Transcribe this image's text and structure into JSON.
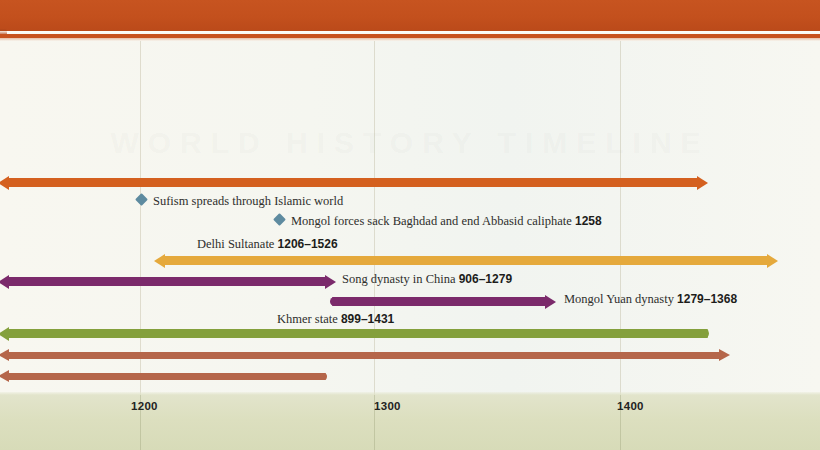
{
  "document": {
    "title": "World history timeline — 1100s to 1400s",
    "top_band_color": "#c8521f",
    "canvas_color": "#f8f7f0",
    "axis_band_color": "#dde0c2",
    "watermark_text": "WORLD HISTORY TIMELINE"
  },
  "axis": {
    "label": "",
    "ticks": [
      {
        "value": "1200",
        "x": 140
      },
      {
        "value": "1300",
        "x": 374
      },
      {
        "value": "1400",
        "x": 620
      }
    ],
    "gridlines": [
      140,
      374,
      620
    ]
  },
  "chart_data": {
    "type": "timeline",
    "title": "World history timeline",
    "xlabel": "",
    "ylabel": "",
    "xlim": [
      1150,
      1440
    ],
    "grid": true,
    "legend": "none",
    "tick_labels": [
      "1200",
      "1300",
      "1400"
    ],
    "bars": [
      {
        "id": "islamic-world-span",
        "label": "",
        "years": "",
        "color": "#d4601f",
        "start_px": 0,
        "end_px": 708,
        "row_y": 178,
        "start_cap": "arrow-left",
        "end_cap": "arrow-right",
        "thickness": "thick"
      },
      {
        "id": "delhi-sultanate",
        "label": "Delhi Sultanate",
        "years": "1206–1526",
        "color": "#e5a93c",
        "start_px": 156,
        "end_px": 778,
        "row_y": 256,
        "start_cap": "arrow-left",
        "end_cap": "arrow-right",
        "thickness": "thick"
      },
      {
        "id": "song-dynasty",
        "label": "Song dynasty in China",
        "years": "906–1279",
        "color": "#7b2a6b",
        "start_px": 0,
        "end_px": 336,
        "row_y": 277,
        "start_cap": "arrow-left",
        "end_cap": "arrow-right",
        "thickness": "thick"
      },
      {
        "id": "mongol-yuan-dynasty",
        "label": "Mongol Yuan dynasty",
        "years": "1279–1368",
        "color": "#7b2a6b",
        "start_px": 332,
        "end_px": 556,
        "row_y": 297,
        "start_cap": "round",
        "end_cap": "arrow-right",
        "thickness": "thick"
      },
      {
        "id": "khmer-state",
        "label": "Khmer state",
        "years": "899–1431",
        "color": "#84a03c",
        "start_px": 0,
        "end_px": 708,
        "row_y": 329,
        "start_cap": "arrow-left",
        "end_cap": "round",
        "thickness": "thick"
      },
      {
        "id": "unlabelled-span-upper",
        "label": "",
        "years": "",
        "color": "#b5664a",
        "start_px": 0,
        "end_px": 730,
        "row_y": 352,
        "start_cap": "arrow-left",
        "end_cap": "arrow-right",
        "thickness": "normal"
      },
      {
        "id": "unlabelled-span-lower",
        "label": "",
        "years": "",
        "color": "#b5664a",
        "start_px": 0,
        "end_px": 326,
        "row_y": 373,
        "start_cap": "arrow-left",
        "end_cap": "round",
        "thickness": "normal"
      }
    ],
    "events": [
      {
        "id": "sufism-spreads",
        "label": "Sufism spreads through Islamic world",
        "year": "",
        "marker": "diamond",
        "marker_color": "#5e8ba0",
        "x": 141,
        "y": 199
      },
      {
        "id": "mongols-sack-baghdad",
        "label": "Mongol forces sack Baghdad and end Abbasid caliphate",
        "year": "1258",
        "marker": "diamond",
        "marker_color": "#5e8ba0",
        "x": 279,
        "y": 219
      }
    ]
  },
  "labels": {
    "delhi": {
      "text": "Delhi Sultanate",
      "years": "1206–1526",
      "x": 197,
      "y": 238
    },
    "song": {
      "text": "Song dynasty in China",
      "years": "906–1279",
      "x": 342,
      "y": 273
    },
    "yuan": {
      "text": "Mongol Yuan dynasty",
      "years": "1279–1368",
      "x": 564,
      "y": 293
    },
    "khmer": {
      "text": "Khmer state",
      "years": "899–1431",
      "x": 277,
      "y": 313
    },
    "sufism": {
      "text": "Sufism spreads through Islamic world",
      "x": 153,
      "y": 195
    },
    "baghdad": {
      "text": "Mongol forces sack Baghdad and end Abbasid caliphate",
      "years": "1258",
      "x": 291,
      "y": 215
    }
  }
}
